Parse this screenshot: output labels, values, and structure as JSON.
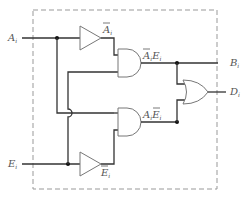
{
  "diagram": {
    "type": "logic-circuit",
    "inputs": [
      {
        "name": "A",
        "sub": "i"
      },
      {
        "name": "E",
        "sub": "i"
      }
    ],
    "outputs": [
      {
        "name": "B",
        "sub": "i"
      },
      {
        "name": "D",
        "sub": "i"
      }
    ],
    "gates": [
      {
        "id": "inv-a",
        "type": "NOT",
        "label_main": "A",
        "label_sub": "i",
        "overbar": true
      },
      {
        "id": "inv-e",
        "type": "NOT",
        "label_main": "E",
        "label_sub": "i",
        "overbar": true
      },
      {
        "id": "and-top",
        "type": "AND",
        "label": "Ā_i E_i",
        "label_parts": [
          {
            "t": "A",
            "bar": true
          },
          {
            "t": "i",
            "sub": true
          },
          {
            "t": "E"
          },
          {
            "t": "i",
            "sub": true
          }
        ]
      },
      {
        "id": "and-bottom",
        "type": "AND",
        "label": "A_i Ē_i",
        "label_parts": [
          {
            "t": "A"
          },
          {
            "t": "i",
            "sub": true
          },
          {
            "t": "E",
            "bar": true
          },
          {
            "t": "i",
            "sub": true
          }
        ]
      },
      {
        "id": "or-out",
        "type": "OR"
      }
    ],
    "colors": {
      "wire": "#333333",
      "gate_outline": "#777777",
      "boundary": "#999999",
      "label": "#555555"
    }
  }
}
